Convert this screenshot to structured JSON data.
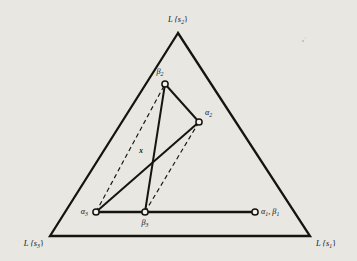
{
  "figure": {
    "type": "geometric-diagram",
    "background_color": "#e9e7e2",
    "ink_color": "#16140f",
    "node_fill": "#ffffff",
    "outer_triangle": {
      "name": "simplex-boundary",
      "vertices": [
        {
          "id": "top",
          "label": "L {s",
          "sub": "2",
          "close": "}",
          "x": 178,
          "y": 33,
          "label_x": 178,
          "label_y": 22,
          "anchor": "middle"
        },
        {
          "id": "bottom_left",
          "label": "L {s",
          "sub": "3",
          "close": "}",
          "x": 50,
          "y": 236,
          "label_x": 44,
          "label_y": 246,
          "anchor": "end"
        },
        {
          "id": "bottom_right",
          "label": "L {s",
          "sub": "1",
          "close": "}",
          "x": 310,
          "y": 236,
          "label_x": 316,
          "label_y": 246,
          "anchor": "start"
        }
      ]
    },
    "nodes": [
      {
        "id": "beta2",
        "label": "β",
        "sub": "2",
        "x": 165,
        "y": 84,
        "label_x": 160,
        "label_y": 74,
        "anchor": "middle",
        "r": 3.1
      },
      {
        "id": "alpha2",
        "label": "α",
        "sub": "2",
        "x": 199,
        "y": 122,
        "label_x": 205,
        "label_y": 115,
        "anchor": "start",
        "r": 3.1
      },
      {
        "id": "alpha3",
        "label": "α",
        "sub": "3",
        "x": 96,
        "y": 212,
        "label_x": 88,
        "label_y": 212,
        "anchor": "end",
        "r": 3.1
      },
      {
        "id": "beta3",
        "label": "β",
        "sub": "3",
        "x": 145,
        "y": 212,
        "label_x": 145,
        "label_y": 224,
        "anchor": "middle",
        "r": 3.1
      },
      {
        "id": "alpha1beta1",
        "label": "α",
        "sub": "1",
        "label2": ", β",
        "sub2": "1",
        "x": 255,
        "y": 212,
        "label_x": 261,
        "label_y": 213,
        "anchor": "start",
        "r": 3.1
      }
    ],
    "point_x": {
      "id": "x",
      "label": "x",
      "x": 150,
      "y": 155,
      "label_x": 143,
      "label_y": 153
    },
    "solid_edges": [
      {
        "id": "beta2-alpha2",
        "from": "beta2",
        "to": "alpha2"
      },
      {
        "id": "beta2-beta3",
        "from": "beta2",
        "to": "beta3"
      },
      {
        "id": "alpha3-alpha2",
        "from": "alpha3",
        "to": "alpha2"
      },
      {
        "id": "alpha3-beta3",
        "from": "alpha3",
        "to": "beta3"
      },
      {
        "id": "beta3-alpha1beta1",
        "from": "beta3",
        "to": "alpha1beta1"
      }
    ],
    "dashed_edges": [
      {
        "id": "alpha3-beta2",
        "from": "alpha3",
        "to": "beta2"
      },
      {
        "id": "beta3-alpha2",
        "from": "beta3",
        "to": "alpha2"
      }
    ]
  }
}
